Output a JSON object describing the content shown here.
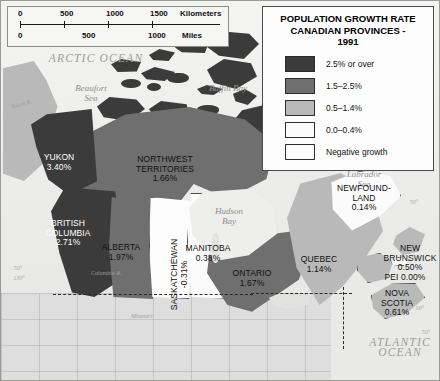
{
  "legend": {
    "title": "POPULATION GROWTH RATE\nCANADIAN PROVINCES -\n1991",
    "entries": [
      {
        "label": "2.5% or over",
        "color": "#3b3b3b"
      },
      {
        "label": "1.5–2.5%",
        "color": "#6f6f6f"
      },
      {
        "label": "0.5–1.4%",
        "color": "#b9b9b9"
      },
      {
        "label": "0.0–0.4%",
        "color": "#fbfbfb"
      },
      {
        "label": "Negative growth",
        "color": "#fcfcfc"
      }
    ]
  },
  "scalebar": {
    "km": {
      "ticks": [
        "0",
        "500",
        "1000",
        "1500"
      ],
      "unit": "Kilometers"
    },
    "mi": {
      "ticks": [
        "0",
        "500",
        "1000"
      ],
      "unit": "Miles"
    }
  },
  "provinces": [
    {
      "name": "YUKON",
      "value": "3.40%",
      "bucket": "2.5% or over"
    },
    {
      "name": "NORTHWEST\nTERRITORIES",
      "value": "1.66%",
      "bucket": "1.5–2.5%"
    },
    {
      "name": "BRITISH\nCOLUMBIA",
      "value": "2.71%",
      "bucket": "2.5% or over"
    },
    {
      "name": "ALBERTA",
      "value": "1.97%",
      "bucket": "1.5–2.5%"
    },
    {
      "name": "SASKATCHEWAN",
      "value": "-0.31%",
      "bucket": "Negative growth"
    },
    {
      "name": "MANITOBA",
      "value": "0.38%",
      "bucket": "0.0–0.4%"
    },
    {
      "name": "ONTARIO",
      "value": "1.67%",
      "bucket": "1.5–2.5%"
    },
    {
      "name": "QUEBEC",
      "value": "1.14%",
      "bucket": "0.5–1.4%"
    },
    {
      "name": "NEWFOUND-\nLAND",
      "value": "0.14%",
      "bucket": "0.0–0.4%"
    },
    {
      "name": "NEW\nBRUNSWICK",
      "value": "0.50%",
      "bucket": "0.5–1.4%"
    },
    {
      "name": "PEI",
      "value": "0.00%",
      "bucket": "0.0–0.4%"
    },
    {
      "name": "NOVA\nSCOTIA",
      "value": "0.61%",
      "bucket": "0.5–1.4%"
    }
  ],
  "province_text": {
    "yukon": "YUKON\n3.40%",
    "nwt": "NORTHWEST\nTERRITORIES\n1.66%",
    "bc": "BRITISH\nCOLUMBIA\n2.71%",
    "alberta": "ALBERTA\n1.97%",
    "saskatchewan": "SASKATCHEWAN\n-0.31%",
    "manitoba": "MANITOBA\n0.38%",
    "ontario": "ONTARIO\n1.67%",
    "quebec": "QUEBEC\n1.14%",
    "newfoundland": "NEWFOUND-\nLAND\n0.14%",
    "new_brunswick": "NEW\nBRUNSWICK\n0.50%",
    "pei": "PEI 0.00%",
    "nova_scotia": "NOVA\nSCOTIA\n0.61%"
  },
  "geography": {
    "arctic_ocean": "ARCTIC OCEAN",
    "atlantic_ocean": "ATLANTIC\nOCEAN",
    "beaufort_sea": "Beaufort\nSea",
    "baffin_bay": "Baffin Bay",
    "hudson_bay": "Hudson\nBay",
    "labrador_sea": "Labrador\nSea",
    "yukon_river": "Yukon R.",
    "columbia_river": "Columbia R.",
    "missouri_river": "Missouri",
    "lat_50_left": "50°",
    "lon_130": "130°",
    "lat_50_right": "50°",
    "lon_60": "60°",
    "lon_50": "50°"
  }
}
